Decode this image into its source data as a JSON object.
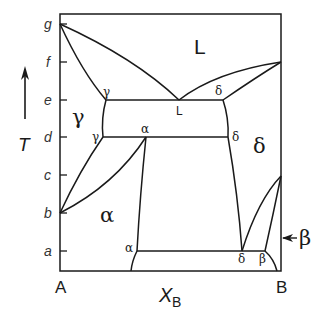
{
  "diagram": {
    "type": "binary phase diagram",
    "temperature_ticks": [
      "g",
      "f",
      "e",
      "d",
      "c",
      "b",
      "a"
    ],
    "temperature_axis_label": "T",
    "composition_axis_label": "X",
    "composition_axis_subscript": "B",
    "left_component": "A",
    "right_component": "B",
    "phase_regions": {
      "liquid": "L",
      "gamma": "γ",
      "alpha": "α",
      "delta": "δ",
      "beta": "β"
    },
    "point_labels": {
      "gamma_e": "γ",
      "liquid_e": "L",
      "delta_e": "δ",
      "gamma_d": "γ",
      "alpha_d": "α",
      "delta_d": "δ",
      "alpha_a": "α",
      "delta_a": "δ",
      "beta_a": "β"
    },
    "beta_arrow_label": "β"
  }
}
